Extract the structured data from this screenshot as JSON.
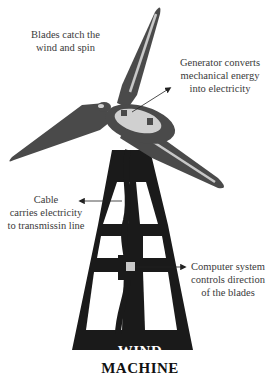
{
  "diagram": {
    "title_line1": "WIND",
    "title_line2": "MACHINE",
    "labels": {
      "blades": [
        "Blades catch the",
        "wind and spin"
      ],
      "generator": [
        "Generator converts",
        "mechanical energy",
        "into electricity"
      ],
      "cable": [
        "Cable",
        "carries electricity",
        "to transmissin line"
      ],
      "computer": [
        "Computer system",
        "controls direction",
        "of the blades"
      ]
    },
    "colors": {
      "blade": "#4a4a4a",
      "blade_stripe": "#c8c8c8",
      "hub": "#d0d0d0",
      "tower": "#1a1a1a",
      "label_text": "#3a3a3a",
      "arrow": "#222222"
    }
  }
}
